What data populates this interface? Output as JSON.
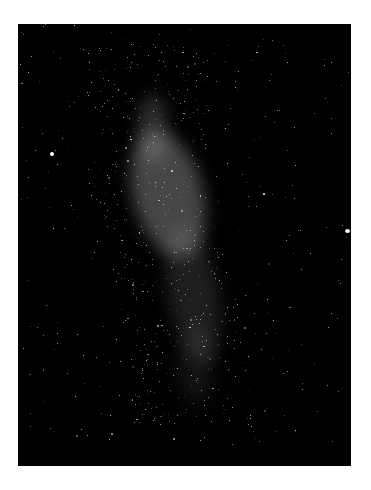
{
  "image": {
    "subject": "Milky Way galaxy night sky",
    "background_color": "#ffffff",
    "photo_color": "#000000"
  }
}
